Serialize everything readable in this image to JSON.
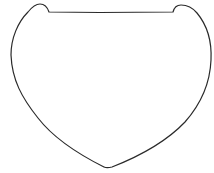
{
  "figure": {
    "background": "#ffffff",
    "stroke_color": "#2a2a2a",
    "stroke_width": 1.2
  }
}
